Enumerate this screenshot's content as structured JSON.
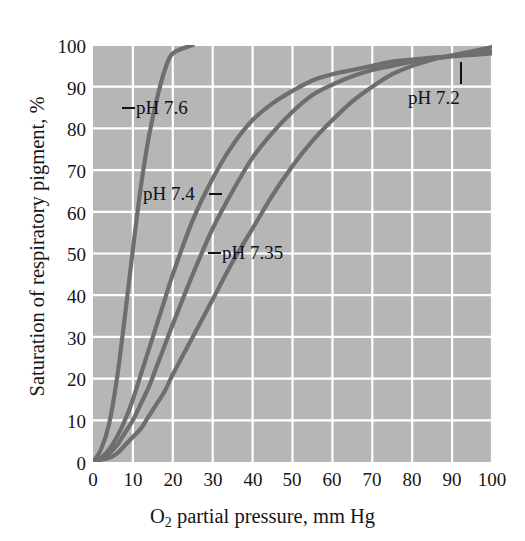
{
  "figure": {
    "background_color": "#ffffff",
    "plot_background_color": "#b6b6b6",
    "grid_color": "#ffffff",
    "curve_color": "#6e6e6e"
  },
  "axes": {
    "y_title": "Saturation of respiratory pigment, %",
    "x_title_pre": "O",
    "x_title_sub": "2",
    "x_title_post": " partial pressure, mm Hg",
    "x_ticks": [
      "0",
      "10",
      "20",
      "30",
      "40",
      "50",
      "60",
      "70",
      "80",
      "90",
      "100"
    ],
    "y_ticks": [
      "0",
      "10",
      "20",
      "30",
      "40",
      "50",
      "60",
      "70",
      "80",
      "90",
      "100"
    ]
  },
  "annotations": [
    {
      "id": "label-ph-76",
      "text": "pH 7.6",
      "leader": "left"
    },
    {
      "id": "label-ph-74",
      "text": "pH 7.4",
      "leader": "right"
    },
    {
      "id": "label-ph-735",
      "text": "pH 7.35",
      "leader": "left"
    },
    {
      "id": "label-ph-72",
      "text": "pH 7.2",
      "leader": "up"
    }
  ],
  "chart_data": {
    "type": "line",
    "title": "",
    "xlabel": "O2 partial pressure, mm Hg",
    "ylabel": "Saturation of respiratory pigment, %",
    "xlim": [
      0,
      100
    ],
    "ylim": [
      0,
      100
    ],
    "xticks": [
      0,
      10,
      20,
      30,
      40,
      50,
      60,
      70,
      80,
      90,
      100
    ],
    "yticks": [
      0,
      10,
      20,
      30,
      40,
      50,
      60,
      70,
      80,
      90,
      100
    ],
    "grid": true,
    "legend": "inline-annotations",
    "x": [
      0,
      2,
      4,
      6,
      8,
      10,
      12,
      14,
      16,
      18,
      20,
      25,
      30,
      35,
      40,
      45,
      50,
      55,
      60,
      65,
      70,
      75,
      80,
      85,
      90,
      95,
      100
    ],
    "series": [
      {
        "name": "pH 7.6",
        "values": [
          0,
          3,
          9,
          20,
          35,
          51,
          66,
          78,
          87,
          94,
          98,
          100,
          100,
          100,
          100,
          100,
          100,
          100,
          100,
          100,
          100,
          100,
          100,
          100,
          100,
          100,
          100
        ]
      },
      {
        "name": "pH 7.4",
        "values": [
          0,
          1,
          3,
          6,
          10,
          15,
          21,
          27,
          33,
          39,
          45,
          58,
          68,
          76,
          82,
          86,
          89,
          91.5,
          93,
          94,
          95,
          96,
          96.5,
          97,
          97.3,
          97.6,
          98
        ]
      },
      {
        "name": "pH 7.35",
        "values": [
          0,
          1,
          2,
          4,
          7,
          10,
          14,
          18,
          23,
          28,
          33,
          45,
          56,
          65,
          73,
          79,
          84,
          88,
          90.5,
          92.5,
          94,
          95,
          96,
          96.7,
          97.3,
          98,
          98.5
        ]
      },
      {
        "name": "pH 7.2",
        "values": [
          0,
          0.5,
          1,
          2,
          4,
          6,
          8,
          11,
          14,
          17,
          21,
          30,
          39,
          48,
          56,
          64,
          71,
          77,
          82,
          86.5,
          90,
          93,
          95,
          96.5,
          97.5,
          98.5,
          99.5
        ]
      }
    ]
  }
}
